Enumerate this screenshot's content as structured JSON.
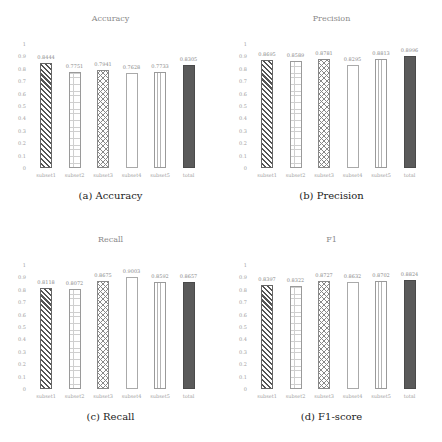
{
  "chart_data": [
    {
      "type": "bar",
      "title": "Accuracy",
      "caption": "(a) Accuracy",
      "categories": [
        "subset1",
        "subset2",
        "subset3",
        "subset4",
        "subset5",
        "total"
      ],
      "values": [
        0.8444,
        0.7751,
        0.7941,
        0.7628,
        0.7733,
        0.8305
      ],
      "value_labels": [
        "0.8444",
        "0.7751",
        "0.7941",
        "0.7628",
        "0.7733",
        "0.8305"
      ],
      "xlabel": "",
      "ylabel": "",
      "ylim": [
        0,
        1
      ],
      "yticks": [
        "0",
        "0.1",
        "0.2",
        "0.3",
        "0.4",
        "0.5",
        "0.6",
        "0.7",
        "0.8",
        "0.9",
        "1"
      ],
      "grid": false,
      "patterns": [
        "diagonal",
        "grid",
        "crosshatch",
        "empty",
        "vertical-lines",
        "solid"
      ]
    },
    {
      "type": "bar",
      "title": "Precision",
      "caption": "(b) Precision",
      "categories": [
        "subset1",
        "subset2",
        "subset3",
        "subset4",
        "subset5",
        "total"
      ],
      "values": [
        0.8695,
        0.8589,
        0.8781,
        0.8295,
        0.8813,
        0.8996
      ],
      "value_labels": [
        "0.8695",
        "0.8589",
        "0.8781",
        "0.8295",
        "0.8813",
        "0.8996"
      ],
      "xlabel": "",
      "ylabel": "",
      "ylim": [
        0,
        1
      ],
      "yticks": [
        "0",
        "0.1",
        "0.2",
        "0.3",
        "0.4",
        "0.5",
        "0.6",
        "0.7",
        "0.8",
        "0.9",
        "1"
      ],
      "grid": false,
      "patterns": [
        "diagonal",
        "grid",
        "crosshatch",
        "empty",
        "vertical-lines",
        "solid"
      ]
    },
    {
      "type": "bar",
      "title": "Recall",
      "caption": "(c) Recall",
      "categories": [
        "subset1",
        "subset2",
        "subset3",
        "subset4",
        "subset5",
        "total"
      ],
      "values": [
        0.8118,
        0.8072,
        0.8675,
        0.9003,
        0.8592,
        0.8657
      ],
      "value_labels": [
        "0.8118",
        "0.8072",
        "0.8675",
        "0.9003",
        "0.8592",
        "0.8657"
      ],
      "xlabel": "",
      "ylabel": "",
      "ylim": [
        0,
        1
      ],
      "yticks": [
        "0",
        "0.1",
        "0.2",
        "0.3",
        "0.4",
        "0.5",
        "0.6",
        "0.7",
        "0.8",
        "0.9",
        "1"
      ],
      "grid": false,
      "patterns": [
        "diagonal",
        "grid",
        "crosshatch",
        "empty",
        "vertical-lines",
        "solid"
      ]
    },
    {
      "type": "bar",
      "title": "F1",
      "caption": "(d) F1-score",
      "categories": [
        "subset1",
        "subset2",
        "subset3",
        "subset4",
        "subset5",
        "total"
      ],
      "values": [
        0.8397,
        0.8322,
        0.8727,
        0.8632,
        0.8702,
        0.8824
      ],
      "value_labels": [
        "0.8397",
        "0.8322",
        "0.8727",
        "0.8632",
        "0.8702",
        "0.8824"
      ],
      "xlabel": "",
      "ylabel": "",
      "ylim": [
        0,
        1
      ],
      "yticks": [
        "0",
        "0.1",
        "0.2",
        "0.3",
        "0.4",
        "0.5",
        "0.6",
        "0.7",
        "0.8",
        "0.9",
        "1"
      ],
      "grid": false,
      "patterns": [
        "diagonal",
        "grid",
        "crosshatch",
        "empty",
        "vertical-lines",
        "solid"
      ]
    }
  ],
  "colors": {
    "solid_bar": "#5a5a5a",
    "axis_text": "#a0a0a0",
    "caption_text": "#222222"
  }
}
